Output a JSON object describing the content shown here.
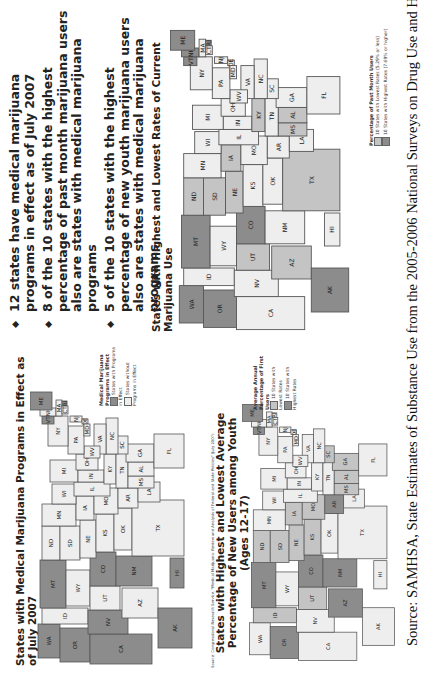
{
  "page": {
    "orientation": "rotated-90-ccw",
    "bullets": [
      "12 states have medical marijuana programs in effect as of July 2007",
      "8 of the 10 states with the highest percentage of past month marijuana users also are states with medical marijuana programs",
      "5 of the 10 states with the highest percentage of new youth marijuana users also are states with medical marijuana programs"
    ],
    "source": "Source: SAMHSA, State Estimates of Substance Use from the 2005-2006 National Surveys on Drug Use and Health."
  },
  "maps": [
    {
      "id": "medical",
      "title": "States with Medical Marijuana Programs in Effect as of July 2007",
      "legend": {
        "title": "Medical Marijuana Programs in Effect",
        "items": [
          {
            "label": "States with Programs in Effect",
            "shade": "dark"
          },
          {
            "label": "States without Programs in Effect",
            "shade": "light"
          }
        ]
      },
      "source_note": "Source: Congressional Research Service, \"Medical Marijuana: Review and Analysis of Federal and State Policies\" (July 2007).",
      "dark_states": [
        "WA",
        "OR",
        "CA",
        "NV",
        "MT",
        "CO",
        "NM",
        "AK",
        "HI",
        "VT",
        "ME",
        "RI"
      ],
      "medium_states": []
    },
    {
      "id": "youth",
      "title": "States with Highest and Lowest Average Percentage of New Users among Youth (Ages 12-17)",
      "legend": {
        "title": "Average Annual Percentage of First Users",
        "items": [
          {
            "label": "10 States with Lowest Rates",
            "shade": "medium"
          },
          {
            "label": "10 States with Highest Rates",
            "shade": "dark"
          }
        ]
      },
      "dark_states": [
        "OR",
        "MT",
        "CO",
        "NM",
        "AZ",
        "AR",
        "VT",
        "ME"
      ],
      "medium_states": [
        "ND",
        "SD",
        "NE",
        "KS",
        "IA",
        "MO",
        "UT",
        "ID",
        "AL",
        "GA",
        "SC",
        "MS"
      ]
    },
    {
      "id": "pastmonth",
      "title": "States with Highest and Lowest Rates of Current Marijuana Use",
      "legend": {
        "title": "Percentage of Past Month Users",
        "items": [
          {
            "label": "10 States with Lowest Rates (5.29% or less)",
            "shade": "medium"
          },
          {
            "label": "10 States with Highest Rates (7.69% or higher)",
            "shade": "dark"
          }
        ]
      },
      "dark_states": [
        "WA",
        "OR",
        "MT",
        "CO",
        "AK",
        "VT",
        "ME",
        "NH",
        "RI"
      ],
      "medium_states": [
        "ND",
        "SD",
        "NE",
        "IA",
        "AZ",
        "TX",
        "UT",
        "KY",
        "MS",
        "AL"
      ]
    }
  ]
}
